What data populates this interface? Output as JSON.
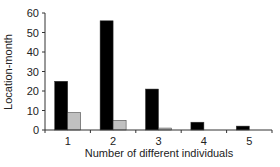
{
  "chart_data": {
    "type": "bar",
    "title": "",
    "xlabel": "Number of different individuals",
    "ylabel": "Location-month",
    "categories": [
      "1",
      "2",
      "3",
      "4",
      "5"
    ],
    "series": [
      {
        "name": "Series A (black)",
        "color": "#000000",
        "values": [
          25,
          56,
          21,
          4,
          2
        ]
      },
      {
        "name": "Series B (gray)",
        "color": "#c0c0c0",
        "values": [
          9,
          5,
          1,
          0,
          0
        ]
      }
    ],
    "ylim": [
      0,
      60
    ],
    "yticks": [
      0,
      10,
      20,
      30,
      40,
      50,
      60
    ],
    "grid": false,
    "legend": "none"
  }
}
